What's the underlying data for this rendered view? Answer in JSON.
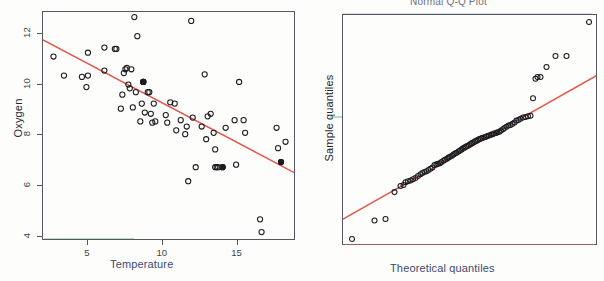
{
  "figure": {
    "background_color": "#fdfdfc",
    "accent_line_color": "#e4564a",
    "axis_color": "#55585e",
    "point_color": "#1c1c20",
    "xlabel_color": "#3b4a74"
  },
  "panels": [
    {
      "id": "scatter",
      "title": "",
      "chart_type": "scatter"
    },
    {
      "id": "qq",
      "title": "Normal Q-Q Plot",
      "chart_type": "scatter"
    }
  ],
  "chart_data": [
    {
      "type": "scatter",
      "title": "",
      "xlabel": "Temperature",
      "ylabel": "Oxygen",
      "xlim": [
        2.0,
        18.9
      ],
      "ylim": [
        3.85,
        12.85
      ],
      "xticks": [
        5,
        10,
        15
      ],
      "xticklabels": [
        "5",
        "10",
        "15"
      ],
      "yticks": [
        4,
        6,
        8,
        10,
        12
      ],
      "yticklabels": [
        "4",
        "6",
        "8",
        "10",
        "12"
      ],
      "grid": false,
      "legend": "none",
      "fit_line": {
        "color": "#e4564a",
        "x": [
          2.0,
          18.9
        ],
        "y": [
          11.75,
          6.5
        ],
        "slope": -0.311,
        "intercept": 12.37
      },
      "x": [
        2.7,
        3.4,
        4.6,
        4.9,
        5.0,
        5.0,
        6.1,
        6.1,
        6.8,
        6.9,
        7.2,
        7.3,
        7.4,
        7.5,
        7.6,
        7.7,
        7.8,
        7.9,
        8.0,
        8.1,
        8.2,
        8.3,
        8.5,
        8.6,
        8.7,
        8.7,
        8.8,
        9.0,
        9.1,
        9.2,
        9.3,
        9.4,
        9.5,
        10.2,
        10.3,
        10.5,
        10.8,
        10.9,
        11.2,
        11.5,
        11.6,
        11.7,
        11.9,
        12.0,
        12.2,
        12.6,
        12.8,
        12.9,
        13.0,
        13.2,
        13.4,
        13.5,
        13.5,
        13.6,
        13.7,
        14.0,
        14.2,
        14.8,
        14.9,
        15.1,
        15.4,
        15.5,
        16.5,
        16.6,
        17.6,
        17.7,
        17.9,
        18.2
      ],
      "y": [
        11.1,
        10.35,
        10.3,
        9.9,
        11.25,
        10.35,
        10.55,
        11.45,
        11.4,
        11.4,
        9.05,
        9.6,
        10.45,
        10.6,
        10.65,
        10.0,
        9.85,
        10.6,
        9.1,
        12.65,
        9.7,
        11.9,
        8.55,
        9.25,
        10.1,
        10.1,
        8.9,
        9.7,
        9.7,
        8.85,
        8.5,
        9.25,
        8.55,
        8.8,
        8.5,
        9.3,
        9.25,
        8.2,
        8.6,
        8.05,
        8.35,
        6.2,
        12.5,
        8.7,
        6.75,
        8.35,
        10.4,
        7.85,
        8.75,
        8.85,
        8.1,
        7.45,
        6.75,
        6.75,
        6.75,
        6.75,
        8.3,
        8.6,
        6.85,
        10.1,
        8.6,
        8.1,
        4.7,
        4.2,
        8.3,
        7.5,
        6.95,
        7.75
      ]
    },
    {
      "type": "scatter",
      "title": "Normal Q-Q Plot",
      "xlabel": "Theoretical quantiles",
      "ylabel": "Sample quantiles",
      "xlim": [
        -2.55,
        2.55
      ],
      "ylim": [
        -3.35,
        4.15
      ],
      "xticks": [
        -2,
        -1,
        0,
        1,
        2
      ],
      "xticklabels": [
        "-2",
        "-1",
        "0",
        "1",
        "2"
      ],
      "yticks": [
        -3,
        -2,
        -1,
        0,
        1,
        2,
        3,
        4
      ],
      "yticklabels": [
        "-3",
        "-2",
        "-1",
        "0",
        "1",
        "2",
        "3",
        "4"
      ],
      "grid": false,
      "legend": "none",
      "fit_line": {
        "color": "#e4564a",
        "x": [
          -2.55,
          2.55
        ],
        "y": [
          -2.48,
          2.21
        ],
        "slope": 0.92,
        "intercept": -0.135
      },
      "x": [
        -2.37,
        -1.92,
        -1.7,
        -1.52,
        -1.4,
        -1.34,
        -1.3,
        -1.25,
        -1.2,
        -1.15,
        -1.1,
        -1.05,
        -1.0,
        -0.96,
        -0.92,
        -0.88,
        -0.84,
        -0.8,
        -0.76,
        -0.72,
        -0.68,
        -0.65,
        -0.61,
        -0.58,
        -0.54,
        -0.51,
        -0.47,
        -0.44,
        -0.41,
        -0.37,
        -0.34,
        -0.31,
        -0.28,
        -0.24,
        -0.21,
        -0.18,
        -0.15,
        -0.12,
        -0.09,
        -0.06,
        -0.03,
        0.0,
        0.03,
        0.06,
        0.09,
        0.12,
        0.15,
        0.18,
        0.21,
        0.24,
        0.28,
        0.31,
        0.34,
        0.37,
        0.41,
        0.44,
        0.47,
        0.51,
        0.54,
        0.58,
        0.61,
        0.65,
        0.68,
        0.72,
        0.76,
        0.8,
        0.84,
        0.88,
        0.92,
        0.96,
        1.0,
        1.05,
        1.1,
        1.15,
        1.2,
        1.25,
        1.3,
        1.34,
        1.4,
        1.52,
        1.7,
        1.92,
        2.37
      ],
      "y": [
        -3.12,
        -2.52,
        -2.47,
        -1.6,
        -1.4,
        -1.37,
        -1.28,
        -1.25,
        -1.22,
        -1.18,
        -1.14,
        -1.08,
        -1.02,
        -0.98,
        -0.95,
        -0.92,
        -0.88,
        -0.84,
        -0.8,
        -0.72,
        -0.7,
        -0.68,
        -0.66,
        -0.62,
        -0.58,
        -0.55,
        -0.52,
        -0.48,
        -0.45,
        -0.42,
        -0.38,
        -0.35,
        -0.32,
        -0.28,
        -0.25,
        -0.22,
        -0.18,
        -0.15,
        -0.12,
        -0.1,
        -0.07,
        -0.04,
        -0.01,
        0.02,
        0.05,
        0.07,
        0.1,
        0.12,
        0.14,
        0.16,
        0.18,
        0.2,
        0.22,
        0.24,
        0.26,
        0.28,
        0.3,
        0.32,
        0.34,
        0.36,
        0.4,
        0.44,
        0.48,
        0.52,
        0.56,
        0.58,
        0.62,
        0.66,
        0.72,
        0.74,
        0.78,
        0.82,
        0.84,
        0.86,
        0.88,
        1.45,
        2.08,
        2.14,
        2.14,
        2.46,
        2.82,
        2.82,
        3.92
      ]
    }
  ]
}
